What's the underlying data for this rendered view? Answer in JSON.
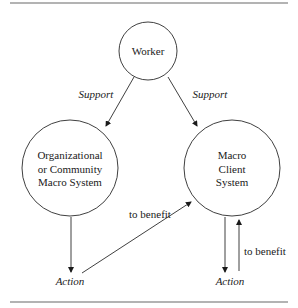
{
  "diagram": {
    "nodes": {
      "worker": {
        "label": "Worker"
      },
      "org": {
        "lines": [
          "Organizational",
          "or Community",
          "Macro System"
        ]
      },
      "client": {
        "lines": [
          "Macro",
          "Client",
          "System"
        ]
      }
    },
    "edges": {
      "support_left": "Support",
      "support_right": "Support",
      "benefit_diag": "to benefit",
      "benefit_up": "to benefit"
    },
    "actions": {
      "left": "Action",
      "right": "Action"
    },
    "colors": {
      "line": "#2a2a2a",
      "rule": "#9a9a9a",
      "text": "#1a1a1a"
    }
  }
}
